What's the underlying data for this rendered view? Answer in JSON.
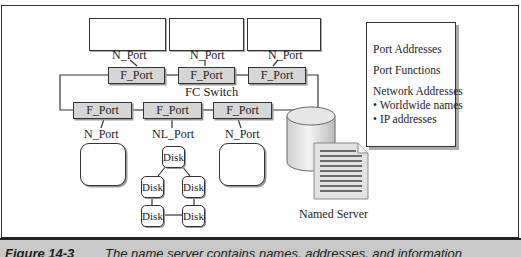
{
  "diagram": {
    "top_nodes": [
      {
        "port_label": "N_Port"
      },
      {
        "port_label": "N_Port"
      },
      {
        "port_label": "N_Port"
      }
    ],
    "switch": {
      "label": "FC Switch",
      "top_ports": [
        "F_Port",
        "F_Port",
        "F_Port"
      ],
      "bottom_ports": [
        "F_Port",
        "F_Port",
        "F_Port"
      ]
    },
    "bottom_nodes": [
      {
        "port_label": "N_Port"
      },
      {
        "port_label": "NL_Port"
      },
      {
        "port_label": "N_Port"
      }
    ],
    "disk_loop": {
      "disks": [
        "Disk",
        "Disk",
        "Disk",
        "Disk",
        "Disk"
      ]
    },
    "named_server": {
      "label": "Named Server"
    },
    "info_box": {
      "items": [
        "Port Addresses",
        "Port Functions",
        "Network Addresses"
      ],
      "bullets": [
        "Worldwide names",
        "IP addresses"
      ]
    }
  },
  "caption": {
    "figure": "Figure 14-3",
    "text": "The name server contains names, addresses, and information"
  }
}
